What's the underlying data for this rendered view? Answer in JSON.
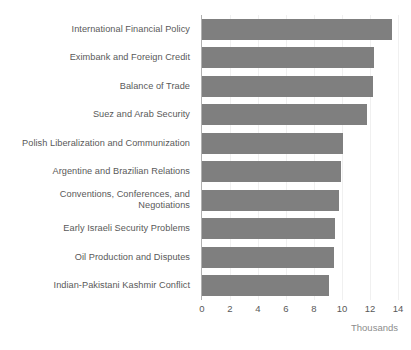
{
  "chart_data": {
    "type": "bar",
    "orientation": "horizontal",
    "title": "",
    "xlabel": "Thousands",
    "ylabel": "",
    "xlim": [
      0,
      14
    ],
    "xticks": [
      0,
      2,
      4,
      6,
      8,
      10,
      12,
      14
    ],
    "xtick_labels": [
      "0",
      "2",
      "4",
      "6",
      "8",
      "10",
      "12",
      "14"
    ],
    "grid": true,
    "legend": false,
    "units": "Thousands",
    "bar_color": "#7f7f7f",
    "label_color": "#595959",
    "caption_color": "#8c8c8c",
    "categories": [
      "International Financial Policy",
      "Eximbank and Foreign Credit",
      "Balance of Trade",
      "Suez and Arab Security",
      "Polish Liberalization and Communization",
      "Argentine and Brazilian Relations",
      "Conventions, Conferences, and\nNegotiations",
      "Early Israeli Security Problems",
      "Oil Production and Disputes",
      "Indian-Pakistani Kashmir Conflict"
    ],
    "values": [
      13.6,
      12.3,
      12.2,
      11.8,
      10.1,
      9.9,
      9.8,
      9.5,
      9.4,
      9.1
    ]
  }
}
